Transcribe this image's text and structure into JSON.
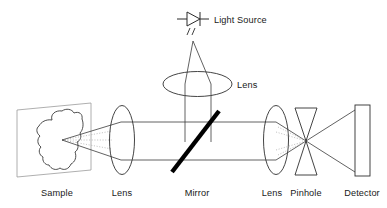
{
  "diagram": {
    "type": "optical-ray-diagram",
    "background_color": "#ffffff",
    "line_color": "#3a3a3a",
    "mirror_color": "#000000",
    "dotted_beam_color": "#b4b4b4",
    "label_color": "#1a1a1a",
    "labels": {
      "light_source": "Light Source",
      "lens_top": "Lens",
      "sample": "Sample",
      "lens_left": "Lens",
      "mirror": "Mirror",
      "lens_right": "Lens",
      "pinhole": "Pinhole",
      "detector": "Detector"
    },
    "components": [
      {
        "id": "light-source",
        "name": "Light Source",
        "icon": "laser-diode-icon",
        "label": "Light Source"
      },
      {
        "id": "lens-top",
        "name": "Lens",
        "shape": "ellipse-horizontal",
        "label": "Lens"
      },
      {
        "id": "sample",
        "name": "Sample",
        "shape": "tilted-plane-with-blob",
        "label": "Sample"
      },
      {
        "id": "lens-left",
        "name": "Lens",
        "shape": "ellipse-vertical",
        "label": "Lens"
      },
      {
        "id": "mirror",
        "name": "Mirror",
        "shape": "diagonal-bar",
        "label": "Mirror"
      },
      {
        "id": "lens-right",
        "name": "Lens",
        "shape": "ellipse-vertical",
        "label": "Lens"
      },
      {
        "id": "pinhole",
        "name": "Pinhole",
        "shape": "bowtie",
        "label": "Pinhole"
      },
      {
        "id": "detector",
        "name": "Detector",
        "shape": "rectangle",
        "label": "Detector"
      }
    ]
  }
}
